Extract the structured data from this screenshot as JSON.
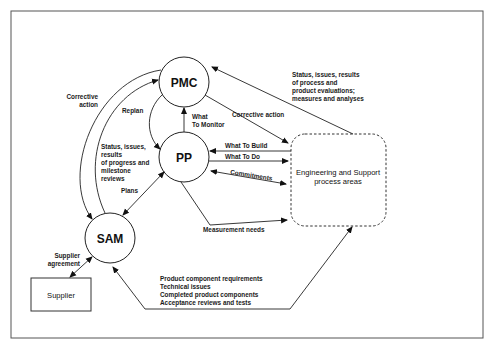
{
  "diagram": {
    "nodes": {
      "pmc": "PMC",
      "pp": "PP",
      "sam": "SAM",
      "supplier": "Supplier",
      "eng_line1": "Engineering and Support",
      "eng_line2": "process areas"
    },
    "labels": {
      "corrective_action_1": "Corrective",
      "corrective_action_2": "action",
      "replan": "Replan",
      "what_to_monitor_1": "What",
      "what_to_monitor_2": "To Monitor",
      "corrective_action_eng": "Corrective action",
      "status_eval_1": "Status, issues, results",
      "status_eval_2": "of process and",
      "status_eval_3": "product evaluations;",
      "status_eval_4": "measures and analyses",
      "status_progress_1": "Status, issues,",
      "status_progress_2": "results",
      "status_progress_3": "of progress and",
      "status_progress_4": "milestone",
      "status_progress_5": "reviews",
      "what_to_build": "What To Build",
      "what_to_do": "What To Do",
      "commitments": "Commitments",
      "plans": "Plans",
      "measurement_needs": "Measurement needs",
      "supplier_agreement_1": "Supplier",
      "supplier_agreement_2": "agreement",
      "product_1": "Product component requirements",
      "product_2": "Technical issues",
      "product_3": "Completed product components",
      "product_4": "Acceptance reviews and tests"
    }
  }
}
